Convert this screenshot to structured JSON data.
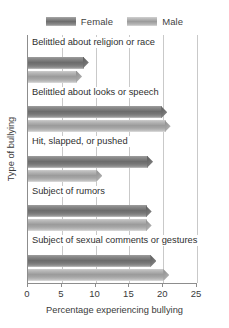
{
  "chart_data": {
    "type": "bar",
    "orientation": "horizontal",
    "title": "",
    "xlabel": "Percentage experiencing bullying",
    "ylabel": "Type of bullying",
    "xlim": [
      0,
      25
    ],
    "xticks": [
      0,
      5,
      10,
      15,
      20,
      25
    ],
    "grid": true,
    "legend_position": "top-center",
    "categories": [
      "Belittled about religion or race",
      "Belittled about looks or speech",
      "Hit, slapped, or pushed",
      "Subject of rumors",
      "Subject of sexual comments or gestures"
    ],
    "series": [
      {
        "name": "Female",
        "color": "#6c6c6c",
        "values": [
          9.0,
          20.6,
          18.5,
          18.3,
          19.0
        ]
      },
      {
        "name": "Male",
        "color": "#9b9b9b",
        "values": [
          8.0,
          21.1,
          11.0,
          18.3,
          20.9
        ]
      }
    ]
  },
  "legend": {
    "items": [
      {
        "label": "Female"
      },
      {
        "label": "Male"
      }
    ]
  },
  "axes": {
    "x": {
      "label": "Percentage experiencing bullying",
      "ticks": [
        "0",
        "5",
        "10",
        "15",
        "20",
        "25"
      ]
    },
    "y": {
      "label": "Type of bullying"
    }
  }
}
